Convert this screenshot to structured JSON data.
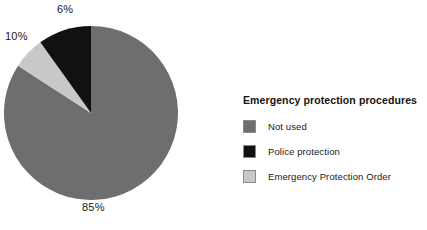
{
  "chart_data": {
    "type": "pie",
    "title": "",
    "legend_title": "Emergency protection procedures",
    "legend_position": "right",
    "categories": [
      "Not used",
      "Police protection",
      "Emergency Protection Order"
    ],
    "values": [
      85,
      10,
      6
    ],
    "data_labels": [
      "85%",
      "10%",
      "6%"
    ],
    "colors": [
      "#6e6e6e",
      "#111111",
      "#c8c8c8"
    ],
    "units": "percent",
    "start_angle_deg": 0,
    "direction": "clockwise",
    "slice_order_from_12oclock_clockwise": [
      "Not used",
      "Emergency Protection Order",
      "Police protection"
    ]
  },
  "legend": {
    "title": "Emergency protection procedures",
    "items": [
      {
        "label": "Not used",
        "color": "#6e6e6e",
        "swatch_name": "legend-swatch-not-used"
      },
      {
        "label": "Police protection",
        "color": "#111111",
        "swatch_name": "legend-swatch-police-protection"
      },
      {
        "label": "Emergency Protection Order",
        "color": "#c8c8c8",
        "swatch_name": "legend-swatch-emergency-protection-order"
      }
    ]
  },
  "pie_labels": {
    "not_used": "85%",
    "police_protection": "10%",
    "emergency_protection_order": "6%"
  }
}
